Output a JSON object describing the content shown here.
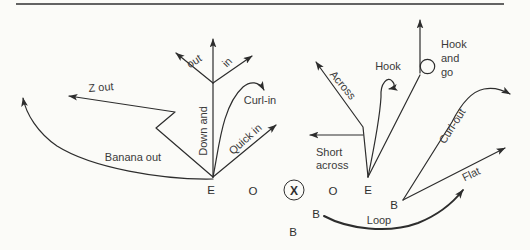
{
  "diagram": {
    "routes": {
      "z_out": "Z out",
      "banana_out": "Banana out",
      "down_and": "Down and",
      "down_and_out": "out",
      "down_and_in": "in",
      "curl_in": "Curl-in",
      "quick_in": "Quick in",
      "across": "Across",
      "hook": "Hook",
      "hook_and_go": [
        "Hook",
        "and",
        "go"
      ],
      "short_across": [
        "Short",
        "across"
      ],
      "curl_out": "Curl-out",
      "flat": "Flat",
      "loop": "Loop"
    },
    "players": {
      "line": [
        "E",
        "O",
        "X",
        "O",
        "E"
      ],
      "backs": [
        "B",
        "B",
        "B"
      ]
    },
    "colors": {
      "line_color": "#2d2d2d",
      "text_color": "#3a3a3a",
      "rule_color": "#636363",
      "background": "#fbfbf8"
    }
  }
}
